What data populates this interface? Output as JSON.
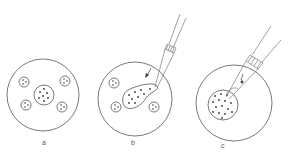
{
  "figure": {
    "panels": [
      {
        "id": "a",
        "label": "a",
        "description": "dish with central cluster and four small satellite clusters"
      },
      {
        "id": "b",
        "label": "b",
        "description": "pipette drawing central cluster into elongated shape, arrow indicating suction"
      },
      {
        "id": "c",
        "label": "c",
        "description": "pipette inserted into enlarged dotted cluster with arrow"
      }
    ],
    "colors": {
      "line": "#6a6a6a",
      "dots": "#3a3a3a",
      "background": "#ffffff"
    }
  }
}
